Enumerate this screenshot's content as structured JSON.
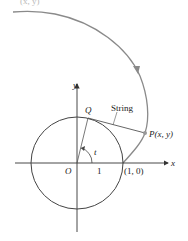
{
  "figure": {
    "colors": {
      "axes": "#333333",
      "circle": "#444444",
      "curve": "#888888",
      "string": "#555555",
      "point": "#999999",
      "text": "#222222"
    },
    "labels": {
      "top_partial": "(x, y)",
      "y_axis": "y",
      "x_axis": "x",
      "origin": "O",
      "point_q": "Q",
      "string": "String",
      "point_p": "P(x, y)",
      "angle": "t",
      "unit_tick": "1",
      "start_point": "(1, 0)"
    }
  }
}
